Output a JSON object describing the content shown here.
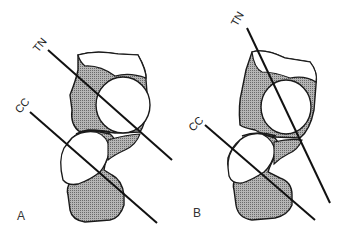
{
  "figure": {
    "panels": [
      {
        "id": "A",
        "label": "A",
        "lines": [
          {
            "label": "TN"
          },
          {
            "label": "CC"
          }
        ]
      },
      {
        "id": "B",
        "label": "B",
        "lines": [
          {
            "label": "TN"
          },
          {
            "label": "CC"
          }
        ]
      }
    ]
  },
  "colors": {
    "outline": "#1a1a1a",
    "shade": "#8c8c8c",
    "background": "#ffffff"
  }
}
